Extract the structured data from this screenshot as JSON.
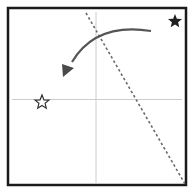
{
  "diagram": {
    "type": "paper-fold-instruction",
    "paper": {
      "x": 8,
      "y": 8,
      "width": 178,
      "height": 177,
      "border_color": "#1a1a1a",
      "fill": "#ffffff"
    },
    "crease_lines": {
      "vertical": {
        "x": 96,
        "y1": 12,
        "y2": 183,
        "color": "#c8c8c8"
      },
      "horizontal": {
        "y": 99.5,
        "x1": 12,
        "x2": 182,
        "color": "#c8c8c8"
      }
    },
    "fold_line": {
      "style": "dashed",
      "x1": 86,
      "y1": 13,
      "x2": 185,
      "y2": 184,
      "color": "#6a6a6a"
    },
    "arrow": {
      "start": [
        151,
        31
      ],
      "control": [
        96,
        28
      ],
      "end": [
        66,
        72
      ],
      "color": "#555555"
    },
    "markers": [
      {
        "name": "source-star",
        "style": "filled",
        "cx": 175,
        "cy": 21,
        "r": 7,
        "color": "#1f1f1f"
      },
      {
        "name": "target-star",
        "style": "hollow",
        "cx": 42,
        "cy": 102,
        "r": 7,
        "color": "#333333"
      }
    ]
  }
}
